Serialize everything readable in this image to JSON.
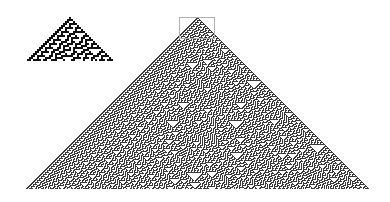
{
  "figure": {
    "rule": 30,
    "colors": {
      "on": "#111111",
      "off": "#ffffff",
      "large_on": "#3a3a3a",
      "box": "#b0b0b0"
    },
    "inset": {
      "steps": 22,
      "cell_px": 2,
      "apex": [
        69,
        17
      ]
    },
    "main": {
      "steps": 172,
      "cell_px": 1,
      "apex": [
        197,
        17
      ],
      "base_y": 189
    },
    "highlight_box": {
      "x": 179,
      "y": 17,
      "width": 36,
      "height": 22
    }
  }
}
